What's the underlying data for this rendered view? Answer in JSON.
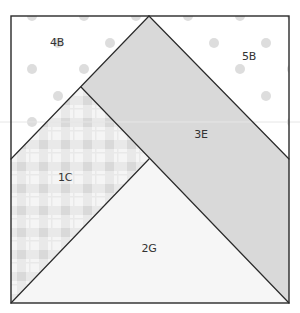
{
  "diagram": {
    "type": "quilt-block-foundation-pattern",
    "colors": {
      "outline": "#2a2a2a",
      "dot_fabric_bg": "#ffffff",
      "dot_color": "#dddddd",
      "plaid_bg": "#f4f4f4",
      "plaid_band": "#e2e2e2",
      "solid_gray": "#d9d9d9",
      "pale_fill": "#f6f6f6"
    },
    "pieces": [
      {
        "id": "4B",
        "label": "4B",
        "fabric": "dots",
        "label_pos": [
          57,
          43
        ]
      },
      {
        "id": "5B",
        "label": "5B",
        "fabric": "dots",
        "label_pos": [
          249,
          57
        ]
      },
      {
        "id": "3E",
        "label": "3E",
        "fabric": "solid-gray",
        "label_pos": [
          201,
          135
        ]
      },
      {
        "id": "1C",
        "label": "1C",
        "fabric": "plaid",
        "label_pos": [
          65,
          178
        ]
      },
      {
        "id": "2G",
        "label": "2G",
        "fabric": "pale",
        "label_pos": [
          149,
          249
        ]
      }
    ]
  }
}
